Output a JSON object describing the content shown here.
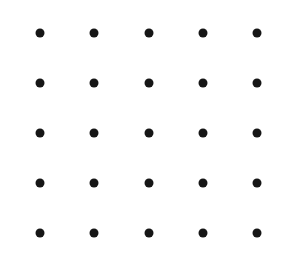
{
  "canvas": {
    "width": 298,
    "height": 270,
    "background_color": "#ffffff",
    "title": "Dot Grid"
  },
  "figure": {
    "name": "five-by-five-dot-grid",
    "rows": 5,
    "columns": 5,
    "dot_count": 25,
    "dot_color": "#161616",
    "dot_diameter_px": 9,
    "column_centers_px": [
      40,
      94,
      149,
      203,
      257
    ],
    "row_centers_px": [
      33,
      83,
      133,
      183,
      233
    ],
    "column_spacing_px": 54,
    "row_spacing_px": 50
  },
  "chart_data": {
    "type": "scatter",
    "title": "",
    "xlabel": "",
    "ylabel": "",
    "grid": false,
    "legend": null,
    "xlim": [
      0,
      298
    ],
    "ylim": [
      0,
      270
    ],
    "series": [
      {
        "name": "dots",
        "marker": "circle",
        "color": "#161616",
        "size_px": 9,
        "points": [
          {
            "x": 40,
            "y": 33
          },
          {
            "x": 94,
            "y": 33
          },
          {
            "x": 149,
            "y": 33
          },
          {
            "x": 203,
            "y": 33
          },
          {
            "x": 257,
            "y": 33
          },
          {
            "x": 40,
            "y": 83
          },
          {
            "x": 94,
            "y": 83
          },
          {
            "x": 149,
            "y": 83
          },
          {
            "x": 203,
            "y": 83
          },
          {
            "x": 257,
            "y": 83
          },
          {
            "x": 40,
            "y": 133
          },
          {
            "x": 94,
            "y": 133
          },
          {
            "x": 149,
            "y": 133
          },
          {
            "x": 203,
            "y": 133
          },
          {
            "x": 257,
            "y": 133
          },
          {
            "x": 40,
            "y": 183
          },
          {
            "x": 94,
            "y": 183
          },
          {
            "x": 149,
            "y": 183
          },
          {
            "x": 203,
            "y": 183
          },
          {
            "x": 257,
            "y": 183
          },
          {
            "x": 40,
            "y": 233
          },
          {
            "x": 94,
            "y": 233
          },
          {
            "x": 149,
            "y": 233
          },
          {
            "x": 203,
            "y": 233
          },
          {
            "x": 257,
            "y": 233
          }
        ]
      }
    ]
  }
}
